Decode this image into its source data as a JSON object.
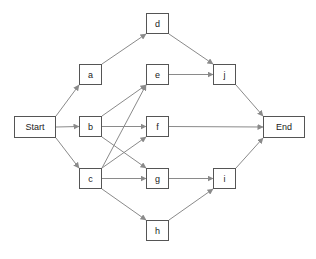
{
  "diagram": {
    "type": "network-precedence-graph",
    "edge_color": "#8a8a8a",
    "node_border_color": "#555555",
    "nodes": [
      {
        "id": "start",
        "label": "Start",
        "x": 14,
        "y": 116,
        "w": 42,
        "h": 22
      },
      {
        "id": "a",
        "label": "a",
        "x": 79,
        "y": 64,
        "w": 23,
        "h": 21
      },
      {
        "id": "b",
        "label": "b",
        "x": 79,
        "y": 116,
        "w": 23,
        "h": 21
      },
      {
        "id": "c",
        "label": "c",
        "x": 79,
        "y": 168,
        "w": 23,
        "h": 21
      },
      {
        "id": "d",
        "label": "d",
        "x": 146,
        "y": 13,
        "w": 23,
        "h": 21
      },
      {
        "id": "e",
        "label": "e",
        "x": 146,
        "y": 64,
        "w": 23,
        "h": 21
      },
      {
        "id": "f",
        "label": "f",
        "x": 146,
        "y": 116,
        "w": 23,
        "h": 21
      },
      {
        "id": "g",
        "label": "g",
        "x": 146,
        "y": 168,
        "w": 23,
        "h": 21
      },
      {
        "id": "h",
        "label": "h",
        "x": 146,
        "y": 220,
        "w": 23,
        "h": 21
      },
      {
        "id": "j",
        "label": "j",
        "x": 213,
        "y": 64,
        "w": 23,
        "h": 21
      },
      {
        "id": "i",
        "label": "i",
        "x": 213,
        "y": 168,
        "w": 23,
        "h": 21
      },
      {
        "id": "end",
        "label": "End",
        "x": 263,
        "y": 116,
        "w": 42,
        "h": 22
      }
    ],
    "edges": [
      {
        "from": "start",
        "to": "a"
      },
      {
        "from": "start",
        "to": "b"
      },
      {
        "from": "start",
        "to": "c"
      },
      {
        "from": "a",
        "to": "d"
      },
      {
        "from": "b",
        "to": "e"
      },
      {
        "from": "b",
        "to": "f"
      },
      {
        "from": "b",
        "to": "g"
      },
      {
        "from": "c",
        "to": "e"
      },
      {
        "from": "c",
        "to": "f"
      },
      {
        "from": "c",
        "to": "g"
      },
      {
        "from": "c",
        "to": "h"
      },
      {
        "from": "d",
        "to": "j"
      },
      {
        "from": "e",
        "to": "j"
      },
      {
        "from": "f",
        "to": "end"
      },
      {
        "from": "g",
        "to": "i"
      },
      {
        "from": "h",
        "to": "i"
      },
      {
        "from": "j",
        "to": "end"
      },
      {
        "from": "i",
        "to": "end"
      }
    ]
  }
}
